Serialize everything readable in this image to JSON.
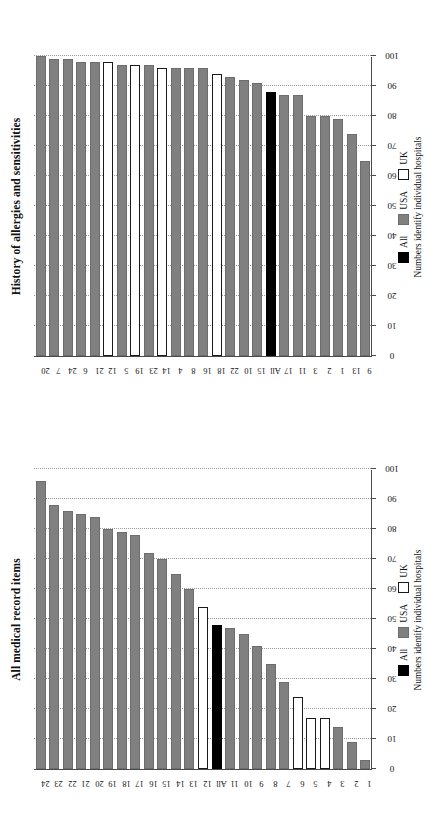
{
  "figure": {
    "legend": {
      "items": [
        {
          "key": "all",
          "label": "All",
          "color": "#000000"
        },
        {
          "key": "usa",
          "label": "USA",
          "color": "#808080"
        },
        {
          "key": "uk",
          "label": "UK",
          "color": "#ffffff"
        }
      ],
      "note": "Numbers identify individual hospitals"
    },
    "axis_title": "Per cent meeting screening criteria"
  },
  "chart_data": [
    {
      "type": "bar",
      "orientation": "horizontal",
      "title": "All medical record items",
      "xlabel": "",
      "ylabel": "Per cent meeting screening criteria",
      "ylim": [
        0,
        100
      ],
      "yticks": [
        0,
        10,
        20,
        30,
        40,
        50,
        60,
        70,
        80,
        90,
        100
      ],
      "grid": true,
      "legend_position": "below",
      "categories": [
        "1",
        "2",
        "3",
        "4",
        "5",
        "6",
        "7",
        "8",
        "9",
        "10",
        "11",
        "All",
        "12",
        "13",
        "14",
        "15",
        "16",
        "17",
        "18",
        "19",
        "20",
        "21",
        "22",
        "23",
        "24"
      ],
      "values": [
        3,
        9,
        14,
        17,
        17,
        24,
        29,
        35,
        41,
        45,
        47,
        48,
        54,
        60,
        65,
        70,
        72,
        78,
        79,
        80,
        84,
        85,
        86,
        88,
        96
      ],
      "groups": [
        "usa",
        "usa",
        "usa",
        "uk",
        "uk",
        "uk",
        "usa",
        "usa",
        "usa",
        "usa",
        "usa",
        "all",
        "uk",
        "usa",
        "usa",
        "usa",
        "usa",
        "usa",
        "usa",
        "usa",
        "usa",
        "usa",
        "usa",
        "usa",
        "usa"
      ]
    },
    {
      "type": "bar",
      "orientation": "horizontal",
      "title": "History of allergies and sensitivities",
      "xlabel": "",
      "ylabel": "Per cent meeting screening criteria",
      "ylim": [
        0,
        100
      ],
      "yticks": [
        0,
        10,
        20,
        30,
        40,
        50,
        60,
        70,
        80,
        90,
        100
      ],
      "grid": true,
      "legend_position": "below",
      "categories": [
        "9",
        "13",
        "1",
        "2",
        "3",
        "11",
        "17",
        "All",
        "15",
        "10",
        "22",
        "18",
        "16",
        "8",
        "4",
        "14",
        "23",
        "19",
        "5",
        "12",
        "21",
        "6",
        "24",
        "7",
        "20"
      ],
      "values": [
        65,
        74,
        79,
        80,
        80,
        87,
        87,
        88,
        91,
        92,
        93,
        94,
        96,
        96,
        96,
        96,
        97,
        97,
        97,
        98,
        98,
        98,
        99,
        99,
        100
      ],
      "groups": [
        "usa",
        "usa",
        "usa",
        "usa",
        "usa",
        "usa",
        "usa",
        "all",
        "usa",
        "usa",
        "usa",
        "uk",
        "usa",
        "usa",
        "usa",
        "uk",
        "usa",
        "uk",
        "usa",
        "uk",
        "usa",
        "usa",
        "usa",
        "usa",
        "usa"
      ]
    }
  ]
}
